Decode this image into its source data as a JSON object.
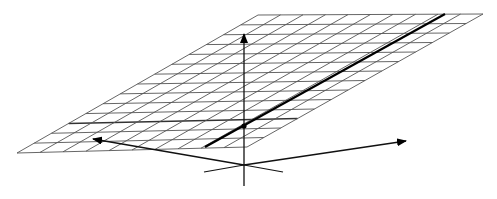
{
  "diagram": {
    "type": "3d-plane-with-axes",
    "colors": {
      "background": "#ffffff",
      "grid": "#555555",
      "axis": "#111111",
      "highlight": "#000000"
    },
    "plane": {
      "corners": {
        "bottom_left": [
          17,
          153
        ],
        "bottom_right": [
          247,
          147
        ],
        "top_right": [
          483,
          14
        ],
        "top_left": [
          258,
          15
        ]
      },
      "rows": 14,
      "cols": 10,
      "emphasized_row_y_fraction": 0.185
    },
    "highlight_line": {
      "from": [
        205,
        147
      ],
      "to": [
        445,
        14
      ]
    },
    "intersection_point": [
      244,
      126
    ],
    "axes": {
      "origin": [
        244,
        165
      ],
      "vertical": {
        "from": [
          244,
          186
        ],
        "to": [
          244,
          34
        ]
      },
      "left": {
        "from": [
          244,
          165
        ],
        "to": [
          93,
          139
        ]
      },
      "right": {
        "from": [
          244,
          165
        ],
        "to": [
          406,
          141
        ]
      },
      "back_left": {
        "from": [
          244,
          165
        ],
        "to": [
          204,
          172
        ]
      },
      "back_right": {
        "from": [
          244,
          165
        ],
        "to": [
          283,
          172
        ]
      }
    }
  }
}
